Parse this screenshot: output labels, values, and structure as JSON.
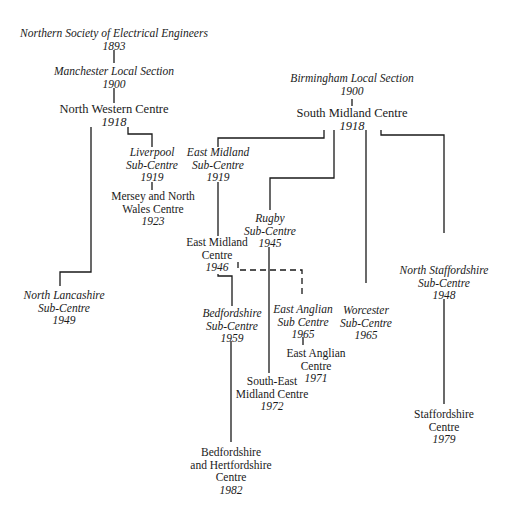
{
  "diagram": {
    "nodes": [
      {
        "id": "nsee",
        "lines": [
          "Northern Society of Electrical Engineers"
        ],
        "year": "1893",
        "italic": true
      },
      {
        "id": "mls",
        "lines": [
          "Manchester Local Section"
        ],
        "year": "1900",
        "italic": true
      },
      {
        "id": "nwc",
        "lines": [
          "North Western Centre"
        ],
        "year": "1918",
        "italic": false
      },
      {
        "id": "lsc",
        "lines": [
          "Liverpool",
          "Sub-Centre"
        ],
        "year": "1919",
        "italic": true
      },
      {
        "id": "mnwc",
        "lines": [
          "Mersey and North",
          "Wales Centre"
        ],
        "year": "1923",
        "italic": false
      },
      {
        "id": "nlsc",
        "lines": [
          "North Lancashire",
          "Sub-Centre"
        ],
        "year": "1949",
        "italic": true
      },
      {
        "id": "bls",
        "lines": [
          "Birmingham Local Section"
        ],
        "year": "1900",
        "italic": true
      },
      {
        "id": "smc",
        "lines": [
          "South Midland Centre"
        ],
        "year": "1918",
        "italic": false
      },
      {
        "id": "emsc",
        "lines": [
          "East Midland",
          "Sub-Centre"
        ],
        "year": "1919",
        "italic": true
      },
      {
        "id": "emc",
        "lines": [
          "East Midland",
          "Centre"
        ],
        "year": "1946",
        "italic": false
      },
      {
        "id": "rsc",
        "lines": [
          "Rugby",
          "Sub-Centre"
        ],
        "year": "1945",
        "italic": true
      },
      {
        "id": "bsc",
        "lines": [
          "Bedfordshire",
          "Sub-Centre"
        ],
        "year": "1959",
        "italic": true
      },
      {
        "id": "easc",
        "lines": [
          "East Anglian",
          "Sub Centre"
        ],
        "year": "1965",
        "italic": true
      },
      {
        "id": "eac",
        "lines": [
          "East Anglian",
          "Centre"
        ],
        "year": "1971",
        "italic": false
      },
      {
        "id": "semc",
        "lines": [
          "South-East",
          "Midland Centre"
        ],
        "year": "1972",
        "italic": false
      },
      {
        "id": "wsc",
        "lines": [
          "Worcester",
          "Sub-Centre"
        ],
        "year": "1965",
        "italic": true
      },
      {
        "id": "nssc",
        "lines": [
          "North Staffordshire",
          "Sub-Centre"
        ],
        "year": "1948",
        "italic": true
      },
      {
        "id": "sc",
        "lines": [
          "Staffordshire",
          "Centre"
        ],
        "year": "1979",
        "italic": false
      },
      {
        "id": "bhc",
        "lines": [
          "Bedfordshire",
          "and Hertfordshire",
          "Centre"
        ],
        "year": "1982",
        "italic": false
      }
    ],
    "edges": [
      {
        "from": "nsee",
        "to": "mls",
        "style": "solid"
      },
      {
        "from": "mls",
        "to": "nwc",
        "style": "solid"
      },
      {
        "from": "nwc",
        "to": "lsc",
        "style": "solid"
      },
      {
        "from": "lsc",
        "to": "mnwc",
        "style": "solid"
      },
      {
        "from": "nwc",
        "to": "nlsc",
        "style": "solid"
      },
      {
        "from": "bls",
        "to": "smc",
        "style": "solid"
      },
      {
        "from": "smc",
        "to": "emsc",
        "style": "solid"
      },
      {
        "from": "smc",
        "to": "rsc",
        "style": "solid"
      },
      {
        "from": "smc",
        "to": "wsc",
        "style": "solid"
      },
      {
        "from": "smc",
        "to": "nssc",
        "style": "solid"
      },
      {
        "from": "emsc",
        "to": "emc",
        "style": "solid"
      },
      {
        "from": "emc",
        "to": "bsc",
        "style": "solid"
      },
      {
        "from": "emc",
        "to": "easc",
        "style": "dashed"
      },
      {
        "from": "easc",
        "to": "eac",
        "style": "solid"
      },
      {
        "from": "rsc",
        "to": "semc",
        "style": "solid"
      },
      {
        "from": "bsc",
        "to": "bhc",
        "style": "solid"
      },
      {
        "from": "nssc",
        "to": "sc",
        "style": "solid"
      }
    ]
  },
  "text": {
    "nsee_l0": "Northern Society of Electrical Engineers",
    "nsee_y": "1893",
    "mls_l0": "Manchester Local Section",
    "mls_y": "1900",
    "nwc_l0": "North Western Centre",
    "nwc_y": "1918",
    "lsc_l0": "Liverpool",
    "lsc_l1": "Sub-Centre",
    "lsc_y": "1919",
    "mnwc_l0": "Mersey and North",
    "mnwc_l1": "Wales Centre",
    "mnwc_y": "1923",
    "nlsc_l0": "North Lancashire",
    "nlsc_l1": "Sub-Centre",
    "nlsc_y": "1949",
    "bls_l0": "Birmingham Local Section",
    "bls_y": "1900",
    "smc_l0": "South Midland Centre",
    "smc_y": "1918",
    "emsc_l0": "East Midland",
    "emsc_l1": "Sub-Centre",
    "emsc_y": "1919",
    "emc_l0": "East Midland",
    "emc_l1": "Centre",
    "emc_y": "1946",
    "rsc_l0": "Rugby",
    "rsc_l1": "Sub-Centre",
    "rsc_y": "1945",
    "bsc_l0": "Bedfordshire",
    "bsc_l1": "Sub-Centre",
    "bsc_y": "1959",
    "easc_l0": "East Anglian",
    "easc_l1": "Sub Centre",
    "easc_y": "1965",
    "eac_l0": "East Anglian",
    "eac_l1": "Centre",
    "eac_y": "1971",
    "semc_l0": "South-East",
    "semc_l1": "Midland Centre",
    "semc_y": "1972",
    "wsc_l0": "Worcester",
    "wsc_l1": "Sub-Centre",
    "wsc_y": "1965",
    "nssc_l0": "North Staffordshire",
    "nssc_l1": "Sub-Centre",
    "nssc_y": "1948",
    "sc_l0": "Staffordshire",
    "sc_l1": "Centre",
    "sc_y": "1979",
    "bhc_l0": "Bedfordshire",
    "bhc_l1": "and Hertfordshire",
    "bhc_l2": "Centre",
    "bhc_y": "1982"
  },
  "colors": {
    "line": "#1a1a1a",
    "background": "#ffffff"
  }
}
